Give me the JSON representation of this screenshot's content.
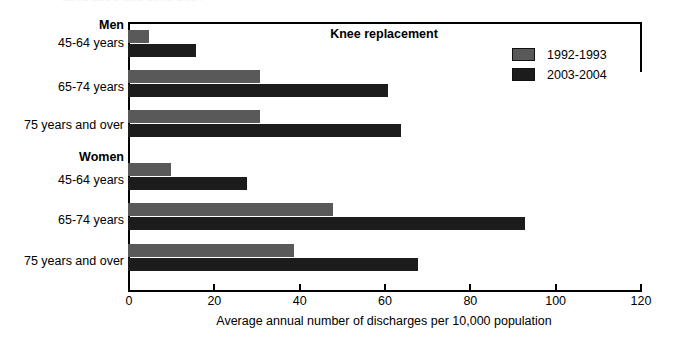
{
  "figure": {
    "top_title": "1992-1993 and 2003-2004",
    "chart_title": "Knee replacement",
    "xaxis_title": "Average annual number of discharges per 10,000 population"
  },
  "legend": {
    "entries": [
      {
        "label": "1992-1993",
        "color": "#595959"
      },
      {
        "label": "2003-2004",
        "color": "#1c1c1c"
      }
    ]
  },
  "axis": {
    "ticks": [
      "0",
      "20",
      "40",
      "60",
      "80",
      "100",
      "120"
    ]
  },
  "groups": [
    {
      "label": "Men"
    },
    {
      "label": "Women"
    }
  ],
  "categories": [
    {
      "label": "45-64 years"
    },
    {
      "label": "65-74 years"
    },
    {
      "label": "75 years and over"
    },
    {
      "label": "45-64 years"
    },
    {
      "label": "65-74 years"
    },
    {
      "label": "75 years and over"
    }
  ],
  "chart_data": {
    "type": "bar",
    "orientation": "horizontal",
    "title": "Knee replacement",
    "subtitle": "1992-1993 and 2003-2004",
    "xlabel": "Average annual number of discharges per 10,000 population",
    "ylabel": "",
    "xlim": [
      0,
      120
    ],
    "xticks": [
      0,
      20,
      40,
      60,
      80,
      100,
      120
    ],
    "grid": false,
    "legend_position": "top-right",
    "group_labels": [
      "Men",
      "Women"
    ],
    "categories": [
      "Men: 45-64 years",
      "Men: 65-74 years",
      "Men: 75 years and over",
      "Women: 45-64 years",
      "Women: 65-74 years",
      "Women: 75 years and over"
    ],
    "series": [
      {
        "name": "1992-1993",
        "color": "#595959",
        "values": [
          5,
          31,
          31,
          10,
          48,
          39
        ]
      },
      {
        "name": "2003-2004",
        "color": "#1c1c1c",
        "values": [
          16,
          61,
          64,
          28,
          93,
          68
        ]
      }
    ]
  }
}
